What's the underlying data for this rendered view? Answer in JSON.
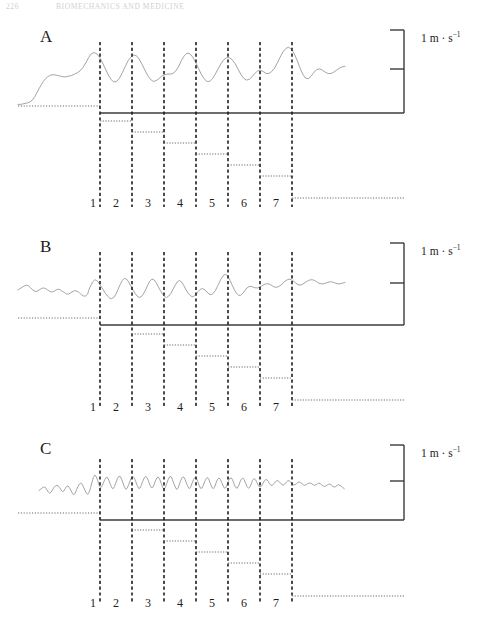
{
  "page": {
    "running_head_page": "226",
    "running_head_title": "BIOMECHANICS AND MEDICINE"
  },
  "figure": {
    "scale_label_text": "1 m · s",
    "scale_label_exponent": "−1",
    "scale_unit_plain": "1 m · s⁻¹",
    "tick_numbers": [
      "1",
      "2",
      "3",
      "4",
      "5",
      "6",
      "7"
    ],
    "axis_color": "#3c3c3c",
    "trace_color": "#9a9a9a",
    "dotted_color": "#6a6a6a",
    "marker_color": "#1e1e1e"
  },
  "panels": [
    {
      "letter": "A",
      "name": "panel-a",
      "description": "velocity trace A with seven event markers",
      "letter_x": 40,
      "letter_y": 28,
      "baseline_y": 113,
      "trace_top": 38,
      "scale_label_x": 421,
      "scale_label_y": 30,
      "tick_number_y": 196,
      "scale_bar": {
        "x": 404,
        "top_y": 30,
        "mid_y": 69,
        "bottom_y": 113,
        "arm": 14
      },
      "stair_start_index": 0,
      "stair_steps": 7,
      "stair_step_height": 11,
      "stair_first_y": 121,
      "trace": "0,101 4,101 8,100 12,99 16,98 20,95 24,89 27,83 30,77 33,71 36,66 39,62 42,59 45,57 48,56 52,56 56,57 60,58 64,59 68,59 72,58 76,57 80,55 84,53 88,50 92,45 96,38 100,30 104,24 108,22 112,24 116,30 120,38 124,47 128,56 132,63 136,67 140,66 144,61 148,53 152,44 156,35 160,29 164,26 168,27 172,32 176,40 180,49 184,57 188,63 192,66 196,65 200,62 204,58 208,56 212,55 216,55 220,54 224,50 228,43 232,34 236,27 240,23 244,24 248,29 252,37 256,46 260,55 264,62 268,66 272,66 276,62 280,55 284,47 288,39 292,33 296,30 300,30 304,33 308,39 312,47 316,55 320,61 324,64 328,63 332,59 336,54 340,50 344,49 348,51 352,54 356,54 360,51 364,46 368,38 372,29 376,21 380,16 384,14 388,17 392,24 396,34 400,45 404,55 408,61 412,62 416,58 420,52 424,48 428,47 432,49 436,52 440,54 444,54 448,52 452,49 456,46 460,44 464,43"
    },
    {
      "letter": "B",
      "name": "panel-b",
      "description": "velocity trace B with seven event markers",
      "letter_x": 40,
      "letter_y": 238,
      "baseline_y": 325,
      "trace_top": 248,
      "scale_label_x": 421,
      "scale_label_y": 243,
      "tick_number_y": 400,
      "scale_bar": {
        "x": 404,
        "top_y": 243,
        "mid_y": 283,
        "bottom_y": 325,
        "arm": 14
      },
      "stair_start_index": 1,
      "stair_steps": 6,
      "stair_step_height": 11,
      "stair_first_y": 334,
      "trace": "0,62 3,60 6,58 9,56 12,55 15,56 18,59 21,62 24,64 27,64 30,62 33,60 36,59 39,60 42,62 45,64 48,65 51,64 54,62 57,61 60,62 63,64 66,66 69,68 72,68 75,66 78,64 81,63 84,64 87,66 90,69 93,71 96,71 99,68 100,63 103,56 106,50 109,47 112,48 115,52 118,57 121,62 124,67 127,71 130,74 133,75 136,73 139,68 142,61 145,54 148,48 151,45 154,46 157,50 160,56 163,62 166,67 169,71 172,73 175,72 178,68 181,62 184,55 187,49 190,46 193,47 196,51 199,57 202,63 205,68 208,72 211,73 214,71 217,67 220,61 223,55 226,50 229,48 232,50 235,55 238,61 241,66 244,70 247,72 250,71 253,68 256,64 259,61 262,60 265,62 268,65 271,68 274,69 277,67 280,63 283,57 286,50 289,44 292,40 295,39 298,42 301,48 304,55 307,62 310,67 313,70 316,70 319,67 322,63 325,59 328,57 331,57 334,58 337,59 340,59 343,58 346,56 349,54 352,53 355,53 358,54 361,56 364,58 367,58 370,57 373,55 376,52 379,49 382,47 385,46 388,47 391,49 394,52 397,54 400,55 403,54 406,52 409,50 412,48 415,47 418,47 421,48 424,50 427,52 430,53 433,53 436,52 439,51 442,50 445,50 448,51 451,52 454,53 457,53 460,52 464,51"
    },
    {
      "letter": "C",
      "name": "panel-c",
      "description": "velocity trace C with seven event markers, low amplitude high frequency",
      "letter_x": 40,
      "letter_y": 440,
      "baseline_y": 520,
      "trace_top": 455,
      "scale_label_x": 421,
      "scale_label_y": 445,
      "tick_number_y": 596,
      "scale_bar": {
        "x": 404,
        "top_y": 445,
        "mid_y": 481,
        "bottom_y": 520,
        "arm": 14
      },
      "stair_start_index": 1,
      "stair_steps": 6,
      "stair_step_height": 11,
      "stair_first_y": 530,
      "trace": "30,63 33,60 36,57 39,58 41,62 43,66 45,68 47,66 49,62 51,58 53,55 55,54 57,55 59,58 61,62 63,65 65,64 67,60 69,56 71,55 73,58 75,63 77,68 79,71 81,68 83,62 85,56 87,52 89,50 91,52 93,57 95,63 97,68 99,70 101,66 103,58 105,48 107,40 109,36 111,38 113,45 115,53 117,58 119,56 121,50 123,44 125,40 127,40 129,45 131,52 133,58 135,60 137,56 139,49 141,42 143,38 145,38 147,43 149,50 151,57 153,61 155,59 157,53 159,46 161,40 163,38 165,41 167,47 169,54 171,59 173,59 175,54 177,47 179,41 181,38 183,40 185,46 187,53 189,58 191,58 193,53 195,46 197,41 199,39 201,43 203,50 205,57 207,61 209,58 211,51 213,44 215,39 217,38 219,43 221,50 223,57 225,61 227,59 229,52 231,45 233,40 235,39 237,43 239,50 241,56 243,60 245,57 247,50 249,44 251,40 253,41 255,47 257,54 259,59 261,59 263,54 265,47 267,42 269,40 271,44 273,51 275,57 277,60 279,57 281,50 283,44 285,41 287,43 289,49 291,55 293,59 295,58 297,52 299,45 301,41 303,41 305,46 307,53 309,58 311,59 313,55 315,48 317,43 319,41 321,44 323,50 325,56 327,59 329,57 331,51 333,45 335,42 337,44 339,49 341,54 343,57 345,56 347,52 349,47 351,44 353,44 355,47 357,51 359,54 361,54 363,51 365,48 367,46 369,46 371,48 373,51 375,53 377,53 379,51 381,48 383,46 385,46 387,48 389,51 391,53 393,53 395,51 397,49 399,48 401,49 403,51 405,53 407,54 409,53 411,51 413,50 415,50 417,51 419,53 421,54 423,53 425,51 427,50 429,51 431,53 433,55 435,56 437,55 439,53 441,52 443,52 445,54 447,56 449,57 451,56 453,54 455,53 457,54 459,56 461,58 463,60"
    }
  ],
  "geometry": {
    "marker_x_positions": [
      100,
      132,
      164,
      196,
      228,
      260,
      292
    ],
    "left_dotted_start": 18,
    "axis_start_x": 100,
    "axis_end_x": 404,
    "tail_end_x": 404,
    "trace_start_x": 18,
    "trace_end_x": 345
  }
}
